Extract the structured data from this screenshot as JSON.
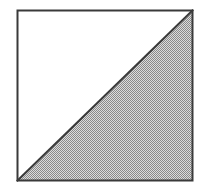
{
  "figure": {
    "caption": "",
    "background_color": "#ffffff",
    "canvas": {
      "width": 205,
      "height": 191
    },
    "square": {
      "name": "square",
      "left": 17.5,
      "top": 10.5,
      "right": 192.5,
      "bottom": 180.5,
      "width": 175,
      "height": 170,
      "stroke_color": "#3a3a3a",
      "stroke_width": 2,
      "fill_color": "#ffffff"
    },
    "diagonal": {
      "name": "diagonal-line",
      "from_corner": "bottom-left",
      "to_corner": "top-right",
      "x1": 17.5,
      "y1": 180.5,
      "x2": 192.5,
      "y2": 10.5,
      "stroke_color": "#3a3a3a",
      "stroke_width": 2
    },
    "regions": [
      {
        "name": "upper-left-triangle",
        "label": "",
        "fill": "white",
        "fill_color": "#ffffff",
        "vertices": "17.5,10.5 192.5,10.5 17.5,180.5"
      },
      {
        "name": "lower-right-triangle",
        "label": "",
        "fill": "gray-dither-halftone",
        "fill_color": "#b4b4b4",
        "dither_dark_color": "#8a8a8a",
        "dither_light_color": "#dcdcdc",
        "vertices": "192.5,10.5 192.5,180.5 17.5,180.5"
      }
    ]
  }
}
